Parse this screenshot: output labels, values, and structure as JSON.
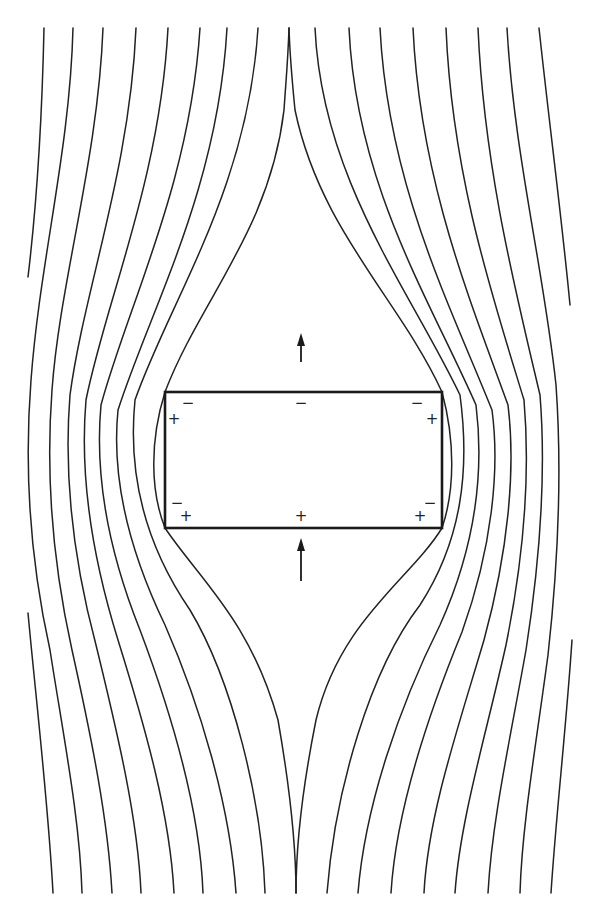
{
  "figure": {
    "stroke_color": "#222222",
    "background": "#ffffff"
  },
  "slab": {
    "x": 165,
    "y": 392,
    "width": 277,
    "height": 136
  },
  "arrows": [
    {
      "name": "arrow-up-top",
      "x": 301,
      "tail_y": 362,
      "tip_y": 333
    },
    {
      "name": "arrow-up-bottom",
      "x": 301,
      "tail_y": 581,
      "tip_y": 538
    }
  ],
  "charges": [
    {
      "name": "charge-top-left-minus",
      "symbol": "−",
      "x": 188,
      "y": 403
    },
    {
      "name": "charge-top-left-plus",
      "symbol": "+",
      "x": 174,
      "y": 419
    },
    {
      "name": "charge-top-center-minus",
      "symbol": "−",
      "x": 301,
      "y": 403
    },
    {
      "name": "charge-top-right-minus",
      "symbol": "−",
      "x": 417,
      "y": 403
    },
    {
      "name": "charge-top-right-plus",
      "symbol": "+",
      "x": 432,
      "y": 419
    },
    {
      "name": "charge-bottom-left-minus",
      "symbol": "−",
      "x": 177,
      "y": 503
    },
    {
      "name": "charge-bottom-left-plus",
      "symbol": "+",
      "x": 186,
      "y": 516
    },
    {
      "name": "charge-bottom-center-plus",
      "symbol": "+",
      "x": 301,
      "y": 516
    },
    {
      "name": "charge-bottom-right-minus",
      "symbol": "−",
      "x": 430,
      "y": 503
    },
    {
      "name": "charge-bottom-right-plus",
      "symbol": "+",
      "x": 420,
      "y": 516
    }
  ],
  "field_lines": [
    {
      "name": "field-line-left-edge-top",
      "d": "M44,28 C42,120 36,210 28,277"
    },
    {
      "name": "field-line-left-edge-bottom",
      "d": "M28,613 C36,700 48,800 53,893"
    },
    {
      "name": "field-line-left-1",
      "d": "M73,28 C70,150 40,260 31,380 C24,470 30,560 50,650 C64,740 80,820 82,893"
    },
    {
      "name": "field-line-left-2",
      "d": "M103,28 C98,160 60,280 52,390 C46,470 52,560 72,650 C92,740 108,820 112,893"
    },
    {
      "name": "field-line-left-3",
      "d": "M136,28 C130,170 84,290 70,395 C64,470 72,555 96,645 C118,735 138,820 141,893"
    },
    {
      "name": "field-line-left-4",
      "d": "M168,28 C160,180 106,300 86,400 C80,470 90,550 118,640 C146,730 170,815 174,893"
    },
    {
      "name": "field-line-left-5",
      "d": "M200,28 C190,185 128,305 101,405 C95,470 106,545 140,630 C172,715 200,810 203,893"
    },
    {
      "name": "field-line-left-6",
      "d": "M227,28 C218,190 150,310 118,410 C112,470 124,540 165,625 C200,705 230,805 236,893"
    },
    {
      "name": "field-line-left-7",
      "d": "M258,28 C248,190 170,300 135,400 C128,470 142,540 190,610 C232,680 262,800 265,893"
    },
    {
      "name": "field-line-left-8",
      "d": "M289,28 C288,60 286,80 284,110 C270,230 200,300 165,392 C150,440 150,490 165,528 C200,580 250,620 278,720 C292,800 296,860 296,893"
    },
    {
      "name": "field-line-right-8",
      "d": "M289,28 C290,60 292,80 295,110 C320,230 400,300 442,392 C455,440 455,490 442,528 C410,580 340,620 316,720 C300,800 296,860 296,893"
    },
    {
      "name": "field-line-right-7",
      "d": "M315,28 C322,180 410,290 460,395 C470,470 462,540 420,605 C370,670 335,790 327,893"
    },
    {
      "name": "field-line-right-6",
      "d": "M349,28 C356,185 430,300 476,405 C484,470 476,545 440,625 C400,705 365,805 358,893"
    },
    {
      "name": "field-line-right-5",
      "d": "M380,28 C388,185 450,305 492,410 C500,470 492,548 462,632 C428,715 396,810 391,893"
    },
    {
      "name": "field-line-right-4",
      "d": "M413,28 C420,180 470,300 508,405 C516,470 508,552 484,640 C458,728 428,815 424,893"
    },
    {
      "name": "field-line-right-3",
      "d": "M446,28 C452,175 492,295 524,400 C530,470 524,556 506,645 C486,735 460,820 455,893"
    },
    {
      "name": "field-line-right-2",
      "d": "M478,28 C484,165 514,285 540,395 C546,470 540,560 526,650 C510,740 492,820 488,893"
    },
    {
      "name": "field-line-right-1",
      "d": "M507,28 C514,155 544,270 556,385 C562,470 558,565 548,655 C536,745 522,825 520,893"
    },
    {
      "name": "field-line-right-edge-top",
      "d": "M539,28 C550,130 562,220 570,305"
    },
    {
      "name": "field-line-right-edge-bottom",
      "d": "M572,640 C566,730 556,815 551,893"
    }
  ]
}
